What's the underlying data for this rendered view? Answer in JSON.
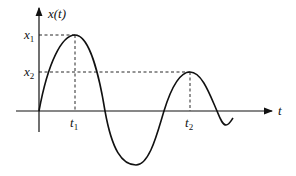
{
  "diagram": {
    "y_axis_label": "x(t)",
    "x_axis_label": "t",
    "levels": [
      {
        "name": "x",
        "sub": "1"
      },
      {
        "name": "x",
        "sub": "2"
      }
    ],
    "times": [
      {
        "name": "t",
        "sub": "1"
      },
      {
        "name": "t",
        "sub": "2"
      }
    ],
    "colors": {
      "stroke": "#111111",
      "background": "#ffffff"
    }
  }
}
